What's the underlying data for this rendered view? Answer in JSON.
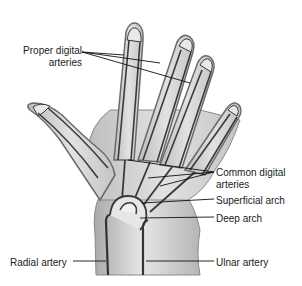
{
  "diagram": {
    "colors": {
      "skin_fill": "#cfcfcf",
      "skin_light": "#e4e4e4",
      "outline": "#6a6a6a",
      "artery": "#3a3a3a",
      "leader_line": "#111111",
      "label_text": "#1a1a1a",
      "background": "#ffffff"
    },
    "labels": {
      "proper_digital": {
        "line1": "Proper digital",
        "line2": "arteries"
      },
      "common_digital": {
        "line1": "Common digital",
        "line2": "arteries"
      },
      "superficial_arch": "Superficial arch",
      "deep_arch": "Deep arch",
      "radial_artery": "Radial artery",
      "ulnar_artery": "Ulnar artery"
    }
  }
}
